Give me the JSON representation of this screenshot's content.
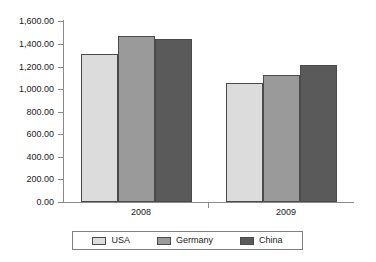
{
  "chart_data": {
    "type": "bar",
    "title": "",
    "subtitle": "",
    "xlabel": "",
    "ylabel": "",
    "categories": [
      "2008",
      "2009"
    ],
    "series": [
      {
        "name": "USA",
        "color": "#dcdcdc",
        "values": [
          1300,
          1050
        ]
      },
      {
        "name": "Germany",
        "color": "#9a9a9a",
        "values": [
          1460,
          1120
        ]
      },
      {
        "name": "China",
        "color": "#5a5a5a",
        "values": [
          1430,
          1200
        ]
      }
    ],
    "ylim": [
      0,
      1600
    ],
    "ytick_step": 200,
    "ytick_labels": [
      "1,600.00",
      "1,400.00",
      "1,200.00",
      "1,000.00",
      "800.00",
      "600.00",
      "400.00",
      "200.00",
      "0.00"
    ],
    "ytick_values": [
      1600,
      1400,
      1200,
      1000,
      800,
      600,
      400,
      200,
      0
    ],
    "grid": false,
    "legend_position": "bottom",
    "legend_entries": [
      "USA",
      "Germany",
      "China"
    ],
    "axis_color": "#8a8a8a",
    "bar_border_color": "#4a4a4a",
    "background_color": "#ffffff"
  }
}
